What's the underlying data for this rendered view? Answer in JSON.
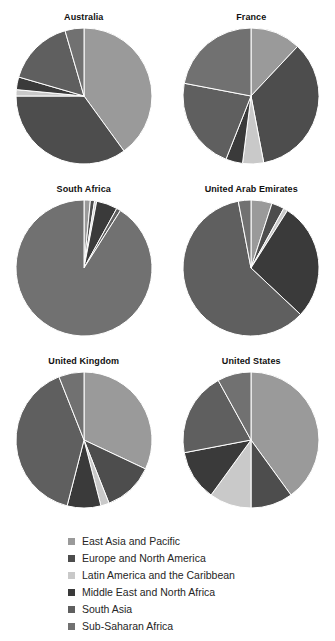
{
  "topcrumb": "",
  "legend": {
    "items": [
      {
        "label": "East Asia and Pacific",
        "key": "eap",
        "color": "#9a9a9a"
      },
      {
        "label": "Europe and North America",
        "key": "ena",
        "color": "#4d4d4d"
      },
      {
        "label": "Latin America and the Caribbean",
        "key": "lac",
        "color": "#c9c9c9"
      },
      {
        "label": "Middle East and North Africa",
        "key": "mena",
        "color": "#3a3a3a"
      },
      {
        "label": "South Asia",
        "key": "sa",
        "color": "#5f5f5f"
      },
      {
        "label": "Sub-Saharan Africa",
        "key": "ssa",
        "color": "#717171"
      }
    ]
  },
  "chart_data": {
    "type": "pie",
    "title": "",
    "xlabel": "",
    "ylabel": "",
    "legend_position": "bottom",
    "grid": false,
    "categories": [
      "East Asia and Pacific",
      "Europe and North America",
      "Latin America and the Caribbean",
      "Middle East and North Africa",
      "South Asia",
      "Sub-Saharan Africa"
    ],
    "colors": [
      "#9a9a9a",
      "#4d4d4d",
      "#c9c9c9",
      "#3a3a3a",
      "#5f5f5f",
      "#717171"
    ],
    "panels": [
      {
        "title": "Australia",
        "values": [
          40.0,
          35.0,
          1.5,
          3.0,
          16.0,
          4.5
        ]
      },
      {
        "title": "France",
        "values": [
          12.0,
          35.0,
          5.0,
          4.0,
          22.0,
          22.0
        ]
      },
      {
        "title": "South Africa",
        "values": [
          1.5,
          1.0,
          0.5,
          5.0,
          1.0,
          91.0
        ]
      },
      {
        "title": "United Arab Emirates",
        "values": [
          5.0,
          3.0,
          1.0,
          28.0,
          60.0,
          3.0
        ]
      },
      {
        "title": "United Kingdom",
        "values": [
          32.0,
          12.0,
          2.0,
          8.0,
          40.0,
          6.0
        ]
      },
      {
        "title": "United States",
        "values": [
          40.0,
          10.0,
          10.0,
          12.0,
          20.0,
          8.0
        ]
      }
    ]
  }
}
